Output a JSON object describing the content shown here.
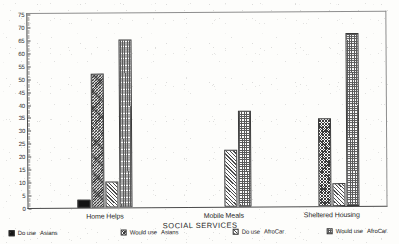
{
  "chart_data": {
    "type": "bar",
    "title": "",
    "xlabel": "SOCIAL SERVICES",
    "ylabel": "",
    "ylim": [
      0,
      75
    ],
    "ytick_step": 5,
    "yticks": [
      0,
      5,
      10,
      15,
      20,
      25,
      30,
      35,
      40,
      45,
      50,
      55,
      60,
      65,
      70,
      75
    ],
    "categories": [
      "Home Helps",
      "Mobile Meals",
      "Sheltered Housing"
    ],
    "grid": false,
    "legend_position": "bottom",
    "series": [
      {
        "name": "Do use  Asians",
        "pattern": "solid-black",
        "values": [
          3,
          0,
          0
        ]
      },
      {
        "name": "Would use  Asians",
        "pattern": "dense-crosshatch",
        "values": [
          52,
          0,
          34
        ]
      },
      {
        "name": "Do use  AfroCar",
        "pattern": "diagonal-hatch",
        "values": [
          10,
          22,
          9
        ]
      },
      {
        "name": "Would use  AfroCar",
        "pattern": "checkerboard",
        "values": [
          65,
          37,
          67
        ]
      }
    ]
  },
  "legend": {
    "items": [
      {
        "action": "Do use",
        "group": "Asians"
      },
      {
        "action": "Would use",
        "group": "Asians"
      },
      {
        "action": "Do use",
        "group": "AfroCar"
      },
      {
        "action": "Would use",
        "group": "AfroCar"
      }
    ]
  }
}
